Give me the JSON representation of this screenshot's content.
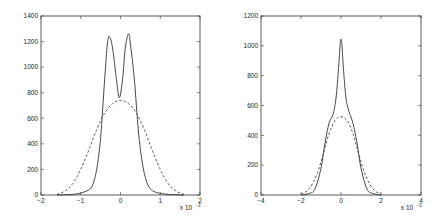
{
  "chart_data": [
    {
      "type": "line",
      "title": "",
      "xlabel": "",
      "ylabel": "",
      "x_multiplier": "x 10^-3",
      "xlim": [
        -2,
        2
      ],
      "ylim": [
        0,
        1400
      ],
      "xticks": [
        -2,
        -1,
        0,
        1,
        2
      ],
      "yticks": [
        0,
        200,
        400,
        600,
        800,
        1000,
        1200,
        1400
      ],
      "grid": false,
      "legend": null,
      "series": [
        {
          "name": "solid",
          "style": "solid",
          "x": [
            -1.6,
            -1.2,
            -1.0,
            -0.8,
            -0.7,
            -0.6,
            -0.5,
            -0.4,
            -0.33,
            -0.28,
            -0.2,
            -0.1,
            -0.03,
            0.05,
            0.12,
            0.2,
            0.25,
            0.35,
            0.45,
            0.55,
            0.65,
            0.75,
            0.9,
            1.2,
            1.6
          ],
          "y": [
            0,
            5,
            15,
            40,
            80,
            200,
            450,
            900,
            1180,
            1240,
            1150,
            900,
            760,
            900,
            1150,
            1260,
            1180,
            900,
            500,
            250,
            110,
            50,
            20,
            5,
            0
          ]
        },
        {
          "name": "dashed",
          "style": "dashed",
          "x": [
            -1.6,
            -1.4,
            -1.2,
            -1.0,
            -0.8,
            -0.6,
            -0.4,
            -0.2,
            0.0,
            0.2,
            0.4,
            0.6,
            0.8,
            1.0,
            1.2,
            1.4,
            1.6
          ],
          "y": [
            5,
            30,
            90,
            200,
            350,
            510,
            640,
            715,
            740,
            715,
            640,
            510,
            350,
            200,
            90,
            30,
            5
          ]
        }
      ]
    },
    {
      "type": "line",
      "title": "",
      "xlabel": "",
      "ylabel": "",
      "x_multiplier": "x 10^-3",
      "xlim": [
        -4,
        4
      ],
      "ylim": [
        0,
        1200
      ],
      "xticks": [
        -4,
        -2,
        0,
        2,
        4
      ],
      "yticks": [
        0,
        200,
        400,
        600,
        800,
        1000,
        1200
      ],
      "grid": false,
      "legend": null,
      "series": [
        {
          "name": "solid",
          "style": "solid",
          "x": [
            -2.0,
            -1.6,
            -1.3,
            -1.0,
            -0.8,
            -0.6,
            -0.4,
            -0.25,
            -0.12,
            -0.05,
            0.0,
            0.05,
            0.12,
            0.25,
            0.4,
            0.6,
            0.8,
            1.0,
            1.3,
            1.6,
            2.0
          ],
          "y": [
            0,
            10,
            40,
            180,
            350,
            480,
            540,
            650,
            850,
            1000,
            1045,
            1000,
            850,
            650,
            560,
            480,
            350,
            180,
            40,
            10,
            0
          ]
        },
        {
          "name": "dashed",
          "style": "dashed",
          "x": [
            -2.0,
            -1.6,
            -1.2,
            -0.9,
            -0.6,
            -0.3,
            0.0,
            0.3,
            0.6,
            0.9,
            1.2,
            1.6,
            2.0
          ],
          "y": [
            5,
            40,
            140,
            270,
            410,
            500,
            525,
            500,
            410,
            270,
            140,
            40,
            5
          ]
        }
      ]
    }
  ],
  "plots": [
    {
      "ytick_labels": [
        "0",
        "200",
        "400",
        "600",
        "800",
        "1000",
        "1200",
        "1400"
      ],
      "xtick_labels": [
        "-2",
        "-1",
        "0",
        "1",
        "2"
      ],
      "multiplier_label": "x 10"
    },
    {
      "ytick_labels": [
        "0",
        "200",
        "400",
        "600",
        "800",
        "1000",
        "1200"
      ],
      "xtick_labels": [
        "-4",
        "-2",
        "0",
        "2",
        "4"
      ],
      "multiplier_label": "x 10"
    }
  ],
  "exponent_label": "-3"
}
